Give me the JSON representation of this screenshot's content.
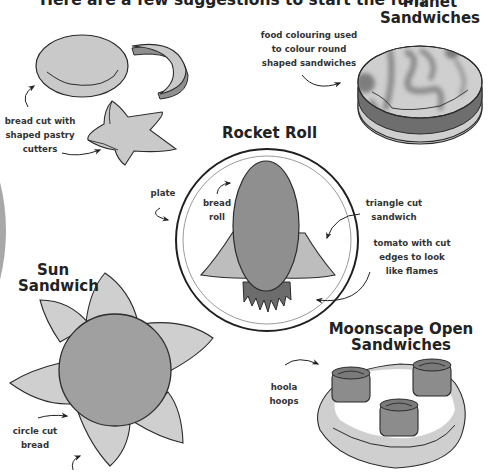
{
  "page": {
    "title": "Here are a few suggestions to start the fun!"
  },
  "sections": {
    "shaped_bread": {
      "label_lines": [
        "bread cut with",
        "shaped pastry",
        "cutters"
      ]
    },
    "planet": {
      "heading_lines": [
        "Planet",
        "Sandwiches"
      ],
      "label_lines": [
        "food colouring used",
        "to colour round",
        "shaped sandwiches"
      ]
    },
    "rocket": {
      "heading": "Rocket Roll",
      "labels": {
        "plate": "plate",
        "bread_roll": [
          "bread",
          "roll"
        ],
        "triangle": [
          "triangle cut",
          "sandwich"
        ],
        "tomato": [
          "tomato with cut",
          "edges to look",
          "like flames"
        ]
      }
    },
    "sun": {
      "heading_lines": [
        "Sun",
        "Sandwich"
      ],
      "label_lines": [
        "circle cut",
        "bread"
      ]
    },
    "moonscape": {
      "heading_lines": [
        "Moonscape Open",
        "Sandwiches"
      ],
      "label_lines": [
        "hoola",
        "hoops"
      ]
    }
  },
  "colors": {
    "outline": "#2b2b2b",
    "light_fill": "#c8c8c8",
    "mid_fill": "#9a9a9a",
    "dark_fill": "#707070",
    "background": "#ffffff"
  },
  "icons": {
    "arrow": "curved-arrow-icon"
  }
}
